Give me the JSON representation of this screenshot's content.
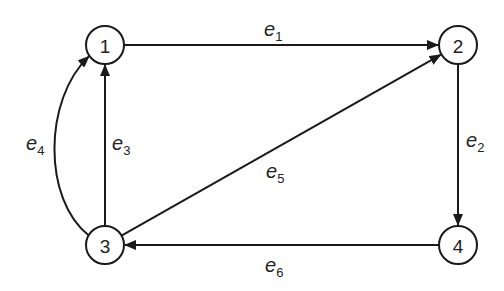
{
  "diagram": {
    "type": "directed-graph",
    "stroke_color": "#1a1a1a",
    "nodes": [
      {
        "id": "1",
        "label": "1"
      },
      {
        "id": "2",
        "label": "2"
      },
      {
        "id": "3",
        "label": "3"
      },
      {
        "id": "4",
        "label": "4"
      }
    ],
    "edges": [
      {
        "id": "e1",
        "letter": "e",
        "sub": "1",
        "from": "1",
        "to": "2",
        "shape": "straight"
      },
      {
        "id": "e2",
        "letter": "e",
        "sub": "2",
        "from": "2",
        "to": "4",
        "shape": "straight"
      },
      {
        "id": "e3",
        "letter": "e",
        "sub": "3",
        "from": "3",
        "to": "1",
        "shape": "straight"
      },
      {
        "id": "e4",
        "letter": "e",
        "sub": "4",
        "from": "3",
        "to": "1",
        "shape": "curved"
      },
      {
        "id": "e5",
        "letter": "e",
        "sub": "5",
        "from": "3",
        "to": "2",
        "shape": "straight"
      },
      {
        "id": "e6",
        "letter": "e",
        "sub": "6",
        "from": "4",
        "to": "3",
        "shape": "straight"
      }
    ]
  }
}
